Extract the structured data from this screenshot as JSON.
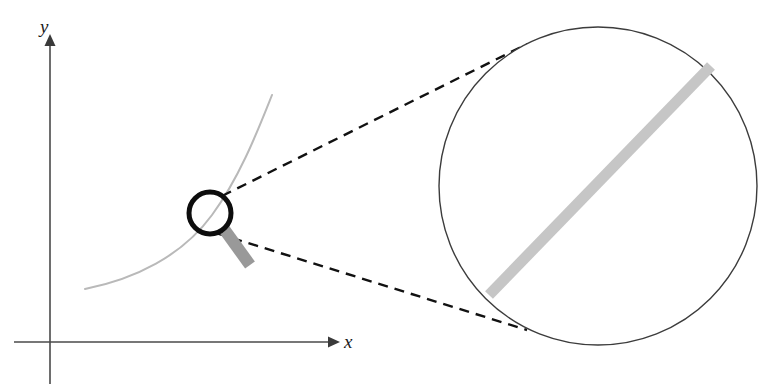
{
  "figure": {
    "background_color": "#ffffff"
  },
  "axes": {
    "x_label": "x",
    "y_label": "y",
    "axis_color": "#4a4a4a",
    "origin": {
      "x": 50,
      "y": 342
    },
    "x_axis": {
      "start_x": 14,
      "end_x": 336,
      "y": 342,
      "arrow": "right"
    },
    "y_axis": {
      "x": 50,
      "start_y": 384,
      "end_y": 38,
      "arrow": "up"
    },
    "x_label_pos": {
      "x": 344,
      "y": 348
    },
    "y_label_pos": {
      "x": 40,
      "y": 33
    }
  },
  "curve": {
    "name": "function-curve",
    "color": "#b9b9b9",
    "stroke_width": 2,
    "path": "M 85 289 C 135 279 182 256 212 215 C 240 177 258 130 272 95",
    "start_point": {
      "x": 85,
      "y": 289
    },
    "end_point": {
      "x": 272,
      "y": 95
    }
  },
  "magnifier": {
    "name": "magnifying-glass",
    "lens_center": {
      "x": 210,
      "y": 213
    },
    "lens_radius": 21,
    "lens_stroke_color": "#0d0d0d",
    "lens_stroke_width": 5,
    "handle_color": "#999999",
    "handle_from": {
      "x": 224,
      "y": 229
    },
    "handle_to": {
      "x": 250,
      "y": 265
    },
    "handle_width": 12
  },
  "zoom_circle": {
    "name": "magnified-view-circle",
    "center": {
      "x": 598,
      "y": 186
    },
    "radius": 159,
    "stroke_color": "#3c3c3c",
    "stroke_width": 1.4,
    "fill": "#ffffff"
  },
  "magnified_band": {
    "name": "magnified-curve-band",
    "color": "#c6c6c6",
    "stroke_width": 11,
    "from": {
      "x": 489,
      "y": 295
    },
    "to": {
      "x": 711,
      "y": 66
    }
  },
  "guides": [
    {
      "name": "upper-guide-line",
      "from": {
        "x": 222,
        "y": 196
      },
      "to": {
        "x": 527,
        "y": 44
      },
      "color": "#111111",
      "stroke_width": 2.4,
      "dash": "10 7"
    },
    {
      "name": "lower-guide-line",
      "from": {
        "x": 216,
        "y": 233
      },
      "to": {
        "x": 527,
        "y": 330
      },
      "color": "#111111",
      "stroke_width": 2.4,
      "dash": "10 7"
    }
  ]
}
